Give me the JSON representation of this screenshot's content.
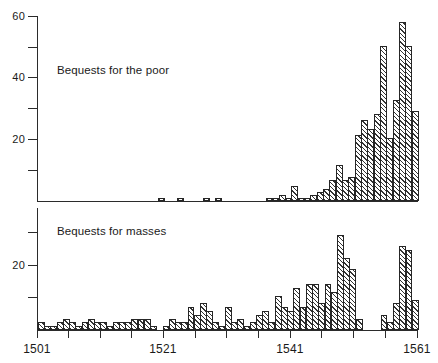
{
  "chart_data": [
    {
      "type": "bar",
      "title": "Bequests for the poor",
      "xlabel": "",
      "ylabel": "",
      "xlim": [
        1501,
        1561
      ],
      "ylim": [
        0,
        62
      ],
      "yticks": [
        0,
        10,
        20,
        30,
        40,
        50,
        60
      ],
      "ytick_labels": [
        "",
        "",
        "20",
        "",
        "40",
        "",
        "60"
      ],
      "xticks": [
        1501,
        1506,
        1511,
        1516,
        1521,
        1526,
        1531,
        1536,
        1541,
        1546,
        1551,
        1556,
        1561
      ],
      "xtick_labels": [
        "1501",
        "",
        "",
        "",
        "1521",
        "",
        "",
        "",
        "1541",
        "",
        "",
        "",
        "1561"
      ],
      "grid": false,
      "legend": "none",
      "x": [
        1501,
        1502,
        1503,
        1504,
        1505,
        1506,
        1507,
        1508,
        1509,
        1510,
        1511,
        1512,
        1513,
        1514,
        1515,
        1516,
        1517,
        1518,
        1519,
        1520,
        1521,
        1522,
        1523,
        1524,
        1525,
        1526,
        1527,
        1528,
        1529,
        1530,
        1531,
        1532,
        1533,
        1534,
        1535,
        1536,
        1537,
        1538,
        1539,
        1540,
        1541,
        1542,
        1543,
        1544,
        1545,
        1546,
        1547,
        1548,
        1549,
        1550,
        1551,
        1552,
        1553,
        1554,
        1555,
        1556,
        1557,
        1558,
        1559,
        1560
      ],
      "values": [
        0,
        0,
        0,
        0,
        0,
        0,
        0,
        0,
        0,
        0,
        0,
        0,
        0,
        0,
        0,
        0,
        0,
        0,
        0,
        1,
        0,
        0,
        1,
        0,
        0,
        0,
        1,
        0,
        1,
        0,
        0,
        0,
        0,
        0,
        0,
        0,
        1,
        1,
        2,
        1,
        5,
        1,
        1,
        2,
        3,
        4,
        7,
        12,
        7,
        8,
        22,
        27,
        24,
        29,
        52,
        21,
        34,
        60,
        52,
        30
      ]
    },
    {
      "type": "bar",
      "title": "Bequests for masses",
      "xlabel": "",
      "ylabel": "",
      "xlim": [
        1501,
        1561
      ],
      "ylim": [
        0,
        32
      ],
      "yticks": [
        0,
        10,
        20,
        30
      ],
      "ytick_labels": [
        "",
        "",
        "20",
        ""
      ],
      "xticks": [
        1501,
        1506,
        1511,
        1516,
        1521,
        1526,
        1531,
        1536,
        1541,
        1546,
        1551,
        1556,
        1561
      ],
      "xtick_labels": [
        "1501",
        "",
        "",
        "",
        "1521",
        "",
        "",
        "",
        "1541",
        "",
        "",
        "",
        "1561"
      ],
      "grid": false,
      "legend": "none",
      "x": [
        1501,
        1502,
        1503,
        1504,
        1505,
        1506,
        1507,
        1508,
        1509,
        1510,
        1511,
        1512,
        1513,
        1514,
        1515,
        1516,
        1517,
        1518,
        1519,
        1520,
        1521,
        1522,
        1523,
        1524,
        1525,
        1526,
        1527,
        1528,
        1529,
        1530,
        1531,
        1532,
        1533,
        1534,
        1535,
        1536,
        1537,
        1538,
        1539,
        1540,
        1541,
        1542,
        1543,
        1544,
        1545,
        1546,
        1547,
        1548,
        1549,
        1550,
        1551,
        1552,
        1553,
        1554,
        1555,
        1556,
        1557,
        1558,
        1559,
        1560
      ],
      "values": [
        2,
        1,
        1,
        2,
        3,
        2,
        1,
        2,
        3,
        2,
        2,
        1,
        2,
        2,
        2,
        3,
        3,
        3,
        1,
        0,
        1,
        3,
        2,
        2,
        6,
        4,
        7,
        5,
        2,
        1,
        6,
        2,
        3,
        1,
        2,
        4,
        5,
        2,
        9,
        6,
        5,
        11,
        6,
        12,
        12,
        7,
        12,
        10,
        25,
        19,
        16,
        3,
        0,
        0,
        0,
        4,
        2,
        7,
        22,
        21,
        8
      ]
    }
  ],
  "panels": {
    "top": {
      "label": "Bequests for the poor"
    },
    "bottom": {
      "label": "Bequests for masses"
    }
  },
  "axes": {
    "y_top_labels": [
      "60",
      "40",
      "20"
    ],
    "y_bottom_labels": [
      "20"
    ],
    "x_labels": [
      "1501",
      "1521",
      "1541",
      "1561"
    ]
  }
}
